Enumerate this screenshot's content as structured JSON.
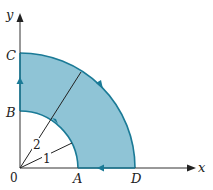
{
  "diagram": {
    "type": "quarter-annulus region in first quadrant with boundary orientation",
    "axes": {
      "x_label": "x",
      "y_label": "y",
      "origin_label": "0"
    },
    "points": [
      {
        "label": "A",
        "meaning": "(1, 0)"
      },
      {
        "label": "B",
        "meaning": "(0, 1)"
      },
      {
        "label": "C",
        "meaning": "(0, 2)"
      },
      {
        "label": "D",
        "meaning": "(2, 0)"
      }
    ],
    "radii": {
      "inner": "1",
      "outer": "2"
    },
    "colors": {
      "fill": "#8fc4d6",
      "boundary": "#1a7a96",
      "axis": "#333333"
    }
  }
}
